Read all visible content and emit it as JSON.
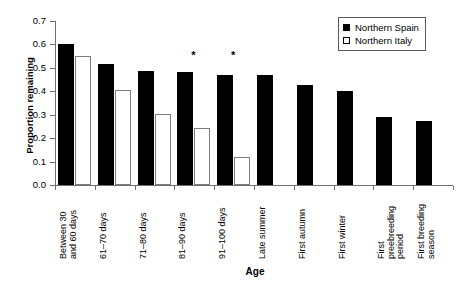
{
  "chart_data": {
    "type": "bar",
    "title": "",
    "xlabel": "Age",
    "ylabel": "Proportion remaining",
    "ylim": [
      0,
      0.7
    ],
    "ytick_labels": [
      "0.0",
      "0.1",
      "0.2",
      "0.3",
      "0.4",
      "0.5",
      "0.6",
      "0.7"
    ],
    "ytick_values": [
      0.0,
      0.1,
      0.2,
      0.3,
      0.4,
      0.5,
      0.6,
      0.7
    ],
    "grid": false,
    "legend_position": "top-right",
    "categories": [
      "Between 30 and 60 days",
      "61–70 days",
      "71–80 days",
      "81–90 days",
      "91–100 days",
      "Late summer",
      "First autumn",
      "First winter",
      "First preebreeding period",
      "First breeding season"
    ],
    "category_lines": [
      [
        "Between 30",
        "and 60 days"
      ],
      [
        "61–70 days"
      ],
      [
        "71–80 days"
      ],
      [
        "81–90 days"
      ],
      [
        "91–100 days"
      ],
      [
        "Late summer"
      ],
      [
        "First autumn"
      ],
      [
        "First winter"
      ],
      [
        "First",
        "preebreeding",
        "period"
      ],
      [
        "First breeding",
        "season"
      ]
    ],
    "series": [
      {
        "name": "Northern Spain",
        "color": "#000000",
        "style": "filled",
        "values": [
          0.6,
          0.515,
          0.487,
          0.482,
          0.471,
          0.471,
          0.425,
          0.402,
          0.292,
          0.272
        ]
      },
      {
        "name": "Northern Italy",
        "color": "#ffffff",
        "style": "open",
        "values": [
          0.549,
          0.406,
          0.303,
          0.244,
          0.121,
          null,
          null,
          null,
          null,
          null
        ]
      }
    ],
    "annotations": [
      {
        "label": "*",
        "category_index": 3,
        "note": "significant difference"
      },
      {
        "label": "*",
        "category_index": 4,
        "note": "significant difference"
      }
    ]
  },
  "legend": {
    "items": [
      {
        "label": "Northern Spain",
        "style": "filled"
      },
      {
        "label": "Northern Italy",
        "style": "open"
      }
    ]
  }
}
